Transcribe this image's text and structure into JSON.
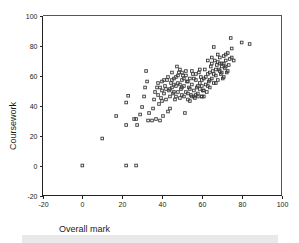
{
  "figure": {
    "background_color": "#ffffff",
    "marker_color": "#3a3a3a",
    "axis_color": "#222222",
    "frame_color": "#555555"
  },
  "footer": {
    "name": "footer-bar",
    "color": "#e9e9e9"
  },
  "chart_data": {
    "type": "scatter",
    "title": "",
    "xlabel": "Overall mark",
    "ylabel": "Coursework",
    "xlim": [
      -20,
      100
    ],
    "ylim": [
      -20,
      100
    ],
    "xticks": [
      -20,
      0,
      20,
      40,
      60,
      80,
      100
    ],
    "yticks": [
      -20,
      0,
      20,
      40,
      60,
      80,
      100
    ],
    "xtick_labels": [
      "-20",
      "0",
      "20",
      "40",
      "60",
      "80",
      "100"
    ],
    "ytick_labels": [
      "-20",
      "0",
      "20",
      "40",
      "60",
      "80",
      "100"
    ],
    "grid": false,
    "legend": null,
    "marker": "open-square",
    "marker_size": 2.6,
    "n_points": 171,
    "points": [
      [
        0,
        0
      ],
      [
        22,
        0
      ],
      [
        27,
        0
      ],
      [
        10,
        18
      ],
      [
        17,
        33
      ],
      [
        22,
        27
      ],
      [
        22,
        42
      ],
      [
        23,
        46.5
      ],
      [
        26,
        31
      ],
      [
        27,
        31
      ],
      [
        27.5,
        27
      ],
      [
        29,
        34
      ],
      [
        30,
        39
      ],
      [
        31,
        46
      ],
      [
        31.5,
        52
      ],
      [
        32,
        63
      ],
      [
        32.5,
        56
      ],
      [
        33,
        30
      ],
      [
        33.5,
        35
      ],
      [
        35,
        30
      ],
      [
        35.5,
        38
      ],
      [
        36,
        44
      ],
      [
        36.5,
        49
      ],
      [
        37,
        31
      ],
      [
        37.5,
        52
      ],
      [
        38,
        47
      ],
      [
        38.5,
        41
      ],
      [
        39,
        30
      ],
      [
        39.5,
        45
      ],
      [
        40,
        50
      ],
      [
        40,
        56
      ],
      [
        40.5,
        33
      ],
      [
        41,
        48
      ],
      [
        41.5,
        53
      ],
      [
        42,
        44
      ],
      [
        42.5,
        57
      ],
      [
        43,
        36
      ],
      [
        43.5,
        50
      ],
      [
        44,
        46
      ],
      [
        44.5,
        55
      ],
      [
        45,
        52
      ],
      [
        45.5,
        48
      ],
      [
        46,
        58
      ],
      [
        46.5,
        44
      ],
      [
        47,
        53
      ],
      [
        47.5,
        66
      ],
      [
        48,
        49
      ],
      [
        48,
        55
      ],
      [
        48.5,
        62
      ],
      [
        49,
        45
      ],
      [
        49.5,
        51
      ],
      [
        50,
        57
      ],
      [
        50,
        47
      ],
      [
        50.5,
        60
      ],
      [
        51,
        53
      ],
      [
        51.5,
        35
      ],
      [
        52,
        49
      ],
      [
        52.5,
        56
      ],
      [
        53,
        44
      ],
      [
        53.5,
        52
      ],
      [
        54,
        58
      ],
      [
        54.5,
        47
      ],
      [
        55,
        54
      ],
      [
        55.5,
        61
      ],
      [
        56,
        50
      ],
      [
        56.5,
        45
      ],
      [
        57,
        57
      ],
      [
        57.5,
        52
      ],
      [
        58,
        48
      ],
      [
        58.5,
        62
      ],
      [
        59,
        55
      ],
      [
        59.5,
        59
      ],
      [
        60,
        46
      ],
      [
        60,
        53
      ],
      [
        60.5,
        50
      ],
      [
        61,
        58
      ],
      [
        61.5,
        64
      ],
      [
        62,
        54
      ],
      [
        62.5,
        49
      ],
      [
        63,
        61
      ],
      [
        63.5,
        56
      ],
      [
        64,
        52
      ],
      [
        64.5,
        66
      ],
      [
        65,
        58
      ],
      [
        65.5,
        63
      ],
      [
        66,
        55
      ],
      [
        66.5,
        70
      ],
      [
        67,
        60
      ],
      [
        67.5,
        67
      ],
      [
        68,
        57
      ],
      [
        68.5,
        64
      ],
      [
        69,
        72
      ],
      [
        69.5,
        61
      ],
      [
        70,
        68
      ],
      [
        70.5,
        58
      ],
      [
        71,
        73
      ],
      [
        71.5,
        65
      ],
      [
        72,
        70
      ],
      [
        72.5,
        62
      ],
      [
        73,
        75
      ],
      [
        73.5,
        67
      ],
      [
        74,
        71
      ],
      [
        74.5,
        85
      ],
      [
        75,
        78
      ],
      [
        76,
        70
      ],
      [
        80,
        82
      ],
      [
        84,
        81
      ],
      [
        44,
        51
      ],
      [
        45,
        57
      ],
      [
        46,
        49
      ],
      [
        47,
        59
      ],
      [
        49,
        54
      ],
      [
        50,
        62
      ],
      [
        51,
        46
      ],
      [
        52,
        60
      ],
      [
        53,
        56
      ],
      [
        54,
        51
      ],
      [
        55,
        63
      ],
      [
        56,
        58
      ],
      [
        57,
        47
      ],
      [
        58,
        53
      ],
      [
        59,
        64
      ],
      [
        60,
        57
      ],
      [
        61,
        50
      ],
      [
        62,
        59
      ],
      [
        63,
        53
      ],
      [
        64,
        62
      ],
      [
        65,
        68
      ],
      [
        66,
        61
      ],
      [
        67,
        55
      ],
      [
        68,
        69
      ],
      [
        69,
        63
      ],
      [
        70,
        66
      ],
      [
        71,
        59
      ],
      [
        72,
        74
      ],
      [
        38,
        55
      ],
      [
        39,
        52
      ],
      [
        40,
        43
      ],
      [
        41,
        57
      ],
      [
        42,
        51
      ],
      [
        43,
        59
      ],
      [
        44,
        38
      ],
      [
        45,
        62
      ],
      [
        46,
        54
      ],
      [
        47,
        46
      ],
      [
        48,
        60
      ],
      [
        49,
        64
      ],
      [
        50,
        52
      ],
      [
        51,
        58
      ],
      [
        52,
        63
      ],
      [
        53,
        48
      ],
      [
        54,
        43
      ],
      [
        55,
        46
      ],
      [
        56,
        46
      ],
      [
        57,
        61
      ],
      [
        58,
        46
      ],
      [
        59,
        51
      ],
      [
        60,
        46
      ],
      [
        61,
        46
      ],
      [
        63,
        70
      ],
      [
        64,
        57
      ],
      [
        65,
        72
      ],
      [
        66,
        79
      ],
      [
        67,
        64
      ],
      [
        68,
        74
      ],
      [
        69,
        68
      ],
      [
        70,
        62
      ],
      [
        71,
        68
      ],
      [
        72,
        66
      ],
      [
        73,
        63
      ],
      [
        75,
        72
      ]
    ]
  }
}
